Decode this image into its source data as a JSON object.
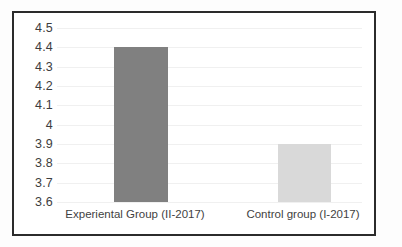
{
  "chart_data": {
    "type": "bar",
    "title": "",
    "subtitle": "",
    "xlabel": "",
    "ylabel": "",
    "categories": [
      "Experiental Group (II-2017)",
      "Control group (I-2017)"
    ],
    "values": [
      4.4,
      3.9
    ],
    "ylim": [
      3.6,
      4.5
    ],
    "yticks": [
      "4.5",
      "4.4",
      "4.3",
      "4.2",
      "4.1",
      "4",
      "3.9",
      "3.8",
      "3.7",
      "3.6"
    ],
    "ytick_values": [
      4.5,
      4.4,
      4.3,
      4.2,
      4.1,
      4.0,
      3.9,
      3.8,
      3.7,
      3.6
    ],
    "grid": true,
    "legend": false,
    "legend_position": "none",
    "annotations": [],
    "bar_colors": [
      "#808080",
      "#d9d9d9"
    ],
    "series": [
      {
        "name": "",
        "values": [
          4.4,
          3.9
        ]
      }
    ]
  },
  "style": {
    "frame_color": "#2b2b2b",
    "plot_background": "#ffffff",
    "gridline_color": "#f0f0f0",
    "tick_label_color": "#3d3d3d",
    "category_label_color": "#3f3f3f"
  }
}
